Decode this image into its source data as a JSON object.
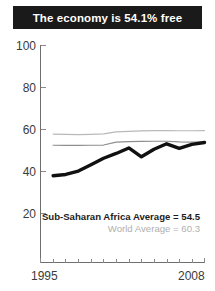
{
  "title": {
    "text": "The economy is 54.1% free"
  },
  "legend": {
    "primary": "Sub-Saharan Africa Average = 54.5",
    "secondary": "World Average = 60.3"
  },
  "axis": {
    "y_ticks": [
      "100",
      "80",
      "60",
      "40",
      "20"
    ],
    "x_start": "1995",
    "x_end": "2008"
  },
  "colors": {
    "banner_bg": "#1a1a1a",
    "banner_text": "#ffffff",
    "country_line": "#111111",
    "ssa_line": "#8e8e8e",
    "world_line": "#b9b9b9",
    "axis": "#6e6e6e"
  },
  "chart_data": {
    "type": "line",
    "title": "The economy is 54.1% free",
    "xlabel": "",
    "ylabel": "",
    "xlim": [
      1995,
      2008
    ],
    "ylim": [
      10,
      100
    ],
    "yticks": [
      20,
      40,
      60,
      80,
      100
    ],
    "xticks": [
      1995,
      1996,
      1997,
      1998,
      1999,
      2000,
      2001,
      2002,
      2003,
      2004,
      2005,
      2006,
      2007,
      2008
    ],
    "grid": false,
    "legend_position": "inside-bottom-right",
    "x": [
      1996,
      1997,
      1998,
      1999,
      2000,
      2001,
      2002,
      2003,
      2004,
      2005,
      2006,
      2007,
      2008
    ],
    "series": [
      {
        "name": "Economic freedom score",
        "style": "thick-black",
        "color": "#111111",
        "values": [
          38.0,
          38.6,
          40.2,
          43.2,
          46.3,
          48.6,
          51.2,
          47.0,
          50.6,
          53.2,
          51.0,
          52.9,
          53.8
        ]
      },
      {
        "name": "Sub-Saharan Africa Average",
        "style": "thin-gray",
        "color": "#8e8e8e",
        "average_label": 54.5,
        "values": [
          52.5,
          52.4,
          52.4,
          52.5,
          52.6,
          54.0,
          54.2,
          54.3,
          54.4,
          54.4,
          54.1,
          54.0,
          54.1
        ]
      },
      {
        "name": "World Average",
        "style": "thin-light-gray",
        "color": "#b9b9b9",
        "average_label": 60.3,
        "values": [
          57.8,
          57.7,
          57.6,
          57.7,
          57.9,
          58.9,
          59.1,
          59.3,
          59.5,
          59.5,
          59.4,
          59.4,
          59.5
        ]
      }
    ]
  }
}
